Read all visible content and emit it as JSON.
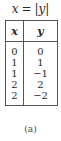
{
  "title": {
    "lhs": "x",
    "equals": "=",
    "rhs": "|y|"
  },
  "table": {
    "headers": [
      "x",
      "y"
    ],
    "rows": [
      [
        "0",
        "0"
      ],
      [
        "1",
        "1"
      ],
      [
        "1",
        "−1"
      ],
      [
        "2",
        "2"
      ],
      [
        "2",
        "−2"
      ]
    ]
  },
  "caption": "(a)"
}
